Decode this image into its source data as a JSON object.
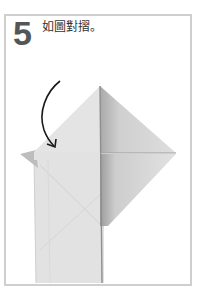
{
  "step": {
    "number": "5",
    "instruction": "如圖對摺。"
  },
  "illustration": {
    "subject": "origami-fold-diagram",
    "arrow": "curved-fold-arrow",
    "colors": {
      "paper_light": "#e4e4e4",
      "paper_mid": "#d6d6d6",
      "paper_dark": "#bdbdbd",
      "shadow": "#9a9a9a",
      "arrow": "#1a1a1a",
      "frame_border": "#cfcfcf",
      "step_number": "#555555"
    }
  }
}
